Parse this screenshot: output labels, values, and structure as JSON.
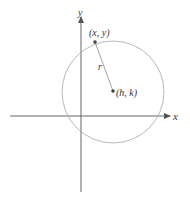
{
  "diagram": {
    "type": "circle-in-coordinate-plane",
    "axes": {
      "x_label": "x",
      "y_label": "y"
    },
    "circle": {
      "center_label": "(h, k)",
      "radius_label": "r",
      "point_label": "(x, y)"
    },
    "colors": {
      "axis": "#555555",
      "circle": "#b0b0b0",
      "radius_line": "#888888",
      "point": "#444444",
      "text": "#333333"
    }
  }
}
